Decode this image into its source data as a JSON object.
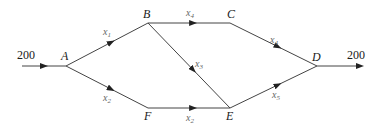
{
  "diagram": {
    "type": "flow-network",
    "nodes": [
      {
        "id": "A",
        "label": "A",
        "x": 66,
        "y": 66,
        "lx": 61,
        "ly": 60
      },
      {
        "id": "B",
        "label": "B",
        "x": 148,
        "y": 23,
        "lx": 143,
        "ly": 18
      },
      {
        "id": "C",
        "label": "C",
        "x": 230,
        "y": 23,
        "lx": 227,
        "ly": 18
      },
      {
        "id": "D",
        "label": "D",
        "x": 317,
        "y": 66,
        "lx": 312,
        "ly": 61
      },
      {
        "id": "E",
        "label": "E",
        "x": 230,
        "y": 108,
        "lx": 226,
        "ly": 120
      },
      {
        "id": "F",
        "label": "F",
        "x": 148,
        "y": 108,
        "lx": 144,
        "ly": 120
      }
    ],
    "edges": [
      {
        "from": "A",
        "to": "B",
        "var": "x",
        "sub": "1",
        "lx": 103,
        "ly": 35
      },
      {
        "from": "A",
        "to": "F",
        "var": "x",
        "sub": "2",
        "lx": 103,
        "ly": 101
      },
      {
        "from": "B",
        "to": "C",
        "var": "x",
        "sub": "4",
        "lx": 186,
        "ly": 16
      },
      {
        "from": "C",
        "to": "D",
        "var": "x",
        "sub": "4",
        "lx": 270,
        "ly": 43
      },
      {
        "from": "B",
        "to": "E",
        "var": "x",
        "sub": "3",
        "lx": 195,
        "ly": 67
      },
      {
        "from": "F",
        "to": "E",
        "var": "x",
        "sub": "2",
        "lx": 186,
        "ly": 121
      },
      {
        "from": "E",
        "to": "D",
        "var": "x",
        "sub": "5",
        "lx": 272,
        "ly": 98
      }
    ],
    "inflow": {
      "value": "200",
      "x1": 22,
      "y": 66,
      "to": "A",
      "lx": 17,
      "ly": 59
    },
    "outflow": {
      "value": "200",
      "x2": 360,
      "y": 66,
      "from": "D",
      "lx": 347,
      "ly": 59
    },
    "colors": {
      "edge": "#444444",
      "node_label": "#1a1a1a",
      "flow_label": "#666666"
    }
  }
}
